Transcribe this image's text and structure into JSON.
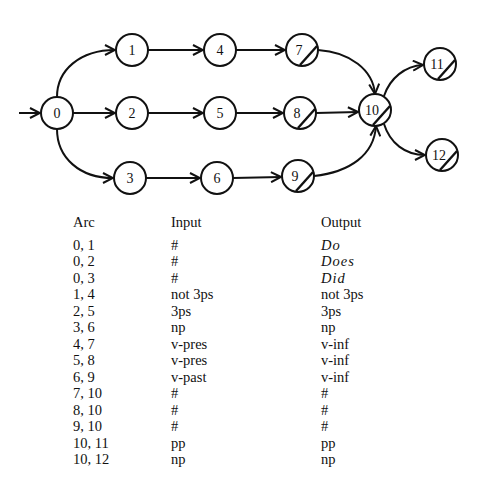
{
  "diagram": {
    "nodes": [
      {
        "id": "0",
        "x": 57,
        "y": 113,
        "final": false
      },
      {
        "id": "1",
        "x": 132,
        "y": 50,
        "final": false
      },
      {
        "id": "2",
        "x": 132,
        "y": 113,
        "final": false
      },
      {
        "id": "3",
        "x": 130,
        "y": 178,
        "final": false
      },
      {
        "id": "4",
        "x": 220,
        "y": 50,
        "final": false
      },
      {
        "id": "5",
        "x": 220,
        "y": 113,
        "final": false
      },
      {
        "id": "6",
        "x": 217,
        "y": 178,
        "final": false
      },
      {
        "id": "7",
        "x": 302,
        "y": 50,
        "final": true
      },
      {
        "id": "8",
        "x": 300,
        "y": 113,
        "final": true
      },
      {
        "id": "9",
        "x": 298,
        "y": 176,
        "final": true
      },
      {
        "id": "10",
        "x": 375,
        "y": 110,
        "final": true
      },
      {
        "id": "11",
        "x": 440,
        "y": 64,
        "final": true
      },
      {
        "id": "12",
        "x": 442,
        "y": 155,
        "final": true
      }
    ],
    "start_node": "0"
  },
  "table": {
    "headers": {
      "arc": "Arc",
      "input": "Input",
      "output": "Output"
    },
    "rows": [
      {
        "arc": "0, 1",
        "input": "#",
        "output": "Do",
        "italic": true
      },
      {
        "arc": "0, 2",
        "input": "#",
        "output": "Does",
        "italic": true
      },
      {
        "arc": "0, 3",
        "input": "#",
        "output": "Did",
        "italic": true
      },
      {
        "arc": "1, 4",
        "input": "not 3ps",
        "output": "not 3ps",
        "italic": false
      },
      {
        "arc": "2, 5",
        "input": "3ps",
        "output": "3ps",
        "italic": false
      },
      {
        "arc": "3, 6",
        "input": "np",
        "output": "np",
        "italic": false
      },
      {
        "arc": "4, 7",
        "input": "v-pres",
        "output": "v-inf",
        "italic": false
      },
      {
        "arc": "5, 8",
        "input": "v-pres",
        "output": "v-inf",
        "italic": false
      },
      {
        "arc": "6, 9",
        "input": "v-past",
        "output": "v-inf",
        "italic": false
      },
      {
        "arc": "7, 10",
        "input": "#",
        "output": "#",
        "italic": false
      },
      {
        "arc": "8, 10",
        "input": "#",
        "output": "#",
        "italic": false
      },
      {
        "arc": "9, 10",
        "input": "#",
        "output": "#",
        "italic": false
      },
      {
        "arc": "10, 11",
        "input": "pp",
        "output": "pp",
        "italic": false
      },
      {
        "arc": "10, 12",
        "input": "np",
        "output": "np",
        "italic": false
      }
    ]
  }
}
